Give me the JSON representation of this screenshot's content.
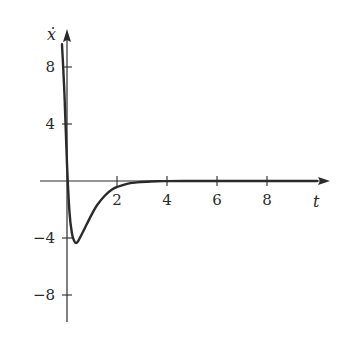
{
  "chart_data": {
    "type": "line",
    "title": "",
    "xlabel": "t",
    "ylabel": "ẋ",
    "xlim": [
      -0.2,
      10.4
    ],
    "ylim": [
      -10,
      10
    ],
    "x_ticks": [
      2,
      4,
      6,
      8
    ],
    "x_tick_labels": [
      "2",
      "4",
      "6",
      "8"
    ],
    "y_ticks": [
      8,
      4,
      -4,
      -8
    ],
    "y_tick_labels": [
      "8",
      "4",
      "−4",
      "−8"
    ],
    "grid": false,
    "legend": null,
    "series": [
      {
        "name": "ẋ(t)",
        "x": [
          -0.2,
          -0.1,
          0.0,
          0.1,
          0.2,
          0.3,
          0.36,
          0.45,
          0.6,
          0.8,
          1.0,
          1.2,
          1.5,
          1.8,
          2.0,
          2.4,
          2.8,
          3.2,
          3.6,
          4.0,
          5.0,
          6.0,
          8.0,
          10.0
        ],
        "values": [
          9.6,
          6.0,
          1.2,
          -2.2,
          -3.7,
          -4.25,
          -4.35,
          -4.2,
          -3.7,
          -3.0,
          -2.3,
          -1.7,
          -1.05,
          -0.6,
          -0.42,
          -0.2,
          -0.1,
          -0.05,
          -0.02,
          -0.01,
          0,
          0,
          0,
          0
        ]
      }
    ]
  }
}
